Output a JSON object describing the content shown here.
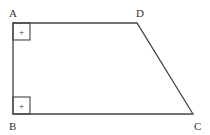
{
  "diagram": {
    "type": "right trapezoid",
    "vertices": [
      {
        "name": "A",
        "x": 13,
        "y": 23,
        "label_x": 9,
        "label_y": 16
      },
      {
        "name": "D",
        "x": 137,
        "y": 23,
        "label_x": 136,
        "label_y": 16
      },
      {
        "name": "C",
        "x": 193,
        "y": 114,
        "label_x": 194,
        "label_y": 130
      },
      {
        "name": "B",
        "x": 13,
        "y": 114,
        "label_x": 9,
        "label_y": 130
      }
    ],
    "right_angle_markers": [
      {
        "at": "A",
        "symbol": "+"
      },
      {
        "at": "B",
        "symbol": "+"
      }
    ],
    "stroke_color": "#444444"
  }
}
